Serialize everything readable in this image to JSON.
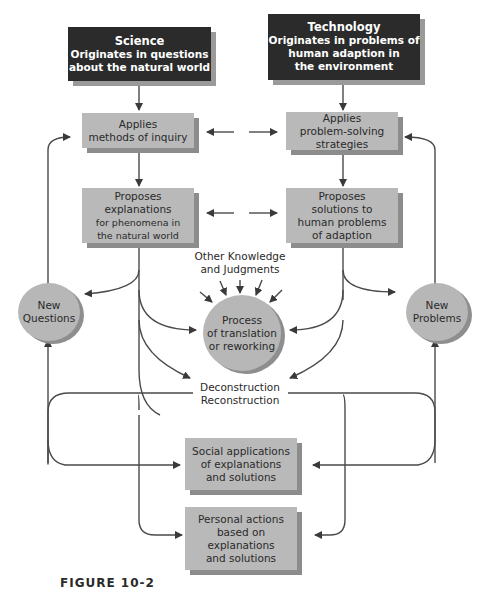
{
  "science": {
    "title": "Science",
    "line1": "Originates in questions",
    "line2": "about the natural world"
  },
  "technology": {
    "title": "Technology",
    "line1": "Originates in problems of",
    "line2": "human adaption in",
    "line3": "the environment"
  },
  "science_inquiry": {
    "line1": "Applies",
    "line2": "methods of inquiry"
  },
  "tech_strategies": {
    "line1": "Applies",
    "line2": "problem-solving",
    "line3": "strategies"
  },
  "science_explanations": {
    "line1": "Proposes",
    "line2": "explanations",
    "line3": "for phenomena in",
    "line4": "the natural world"
  },
  "tech_solutions": {
    "line1": "Proposes",
    "line2": "solutions to",
    "line3": "human problems",
    "line4": "of adaption"
  },
  "other_knowledge": {
    "line1": "Other Knowledge",
    "line2": "and Judgments"
  },
  "process": {
    "line1": "Process",
    "line2": "of translation",
    "line3": "or reworking"
  },
  "new_questions": {
    "line1": "New",
    "line2": "Questions"
  },
  "new_problems": {
    "line1": "New",
    "line2": "Problems"
  },
  "deconstruction": {
    "line1": "Deconstruction",
    "line2": "Reconstruction"
  },
  "social": {
    "line1": "Social applications",
    "line2": "of explanations",
    "line3": "and solutions"
  },
  "personal": {
    "line1": "Personal actions",
    "line2": "based on",
    "line3": "explanations",
    "line4": "and solutions"
  },
  "caption": "FIGURE 10-2",
  "colors": {
    "dark_box": "#2b2b2b",
    "grey_box": "#b9b9b9",
    "shadow": "#8c8c8c",
    "line": "#4a4a4a"
  }
}
